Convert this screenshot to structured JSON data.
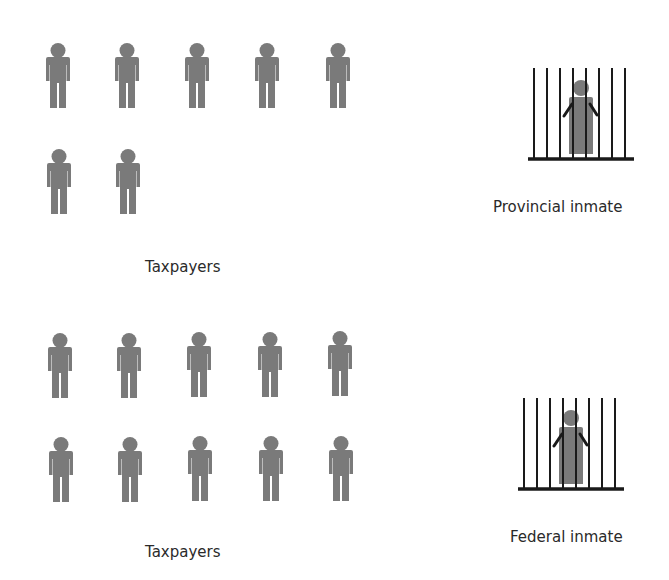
{
  "colors": {
    "figure": "#7a7a7a",
    "bars": "#1a1a1a",
    "text": "#2a2a2a",
    "background": "#ffffff"
  },
  "sections": [
    {
      "name": "provincial",
      "taxpayer_count": 7,
      "taxpayers_label": "Taxpayers",
      "inmate_label": "Provincial inmate",
      "icon": "person-icon",
      "inmate_icon": "jailed-person-icon"
    },
    {
      "name": "federal",
      "taxpayer_count": 10,
      "taxpayers_label": "Taxpayers",
      "inmate_label": "Federal inmate",
      "icon": "person-icon",
      "inmate_icon": "jailed-person-icon"
    }
  ]
}
